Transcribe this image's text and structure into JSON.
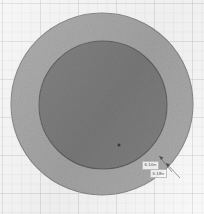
{
  "figure": {
    "background_color": "#fcfcfc",
    "grid_visible": true,
    "outer_circle": {
      "name": "outer-ring",
      "fill_color": "#a8a8a8",
      "stroke_color": "#8a8a8a",
      "center_x": 102,
      "center_y": 104,
      "radius": 91
    },
    "inner_circle": {
      "name": "inner-disc",
      "fill_color": "#7d7d7d",
      "stroke_color": "#5f5f5f",
      "center_x": 103,
      "center_y": 105,
      "radius": 64
    },
    "point_marker": {
      "name": "point-marker",
      "x": 119,
      "y": 145,
      "color": "#2e2e2e"
    },
    "leader_lines": [
      {
        "name": "leader-outer",
        "from_x": 166,
        "from_y": 163,
        "to_x": 180,
        "to_y": 178
      },
      {
        "name": "leader-inner",
        "from_x": 159,
        "from_y": 156,
        "to_x": 172,
        "to_y": 172
      }
    ]
  },
  "callouts": {
    "outer": {
      "value": "6.10",
      "unit": "m"
    },
    "inner": {
      "value": "5.18",
      "unit": "m"
    }
  }
}
